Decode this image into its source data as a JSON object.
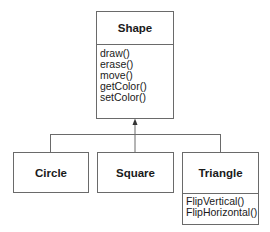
{
  "diagram": {
    "type": "uml-class-inheritance",
    "line_color": "#6a6a6a",
    "parent": {
      "name": "Shape",
      "operations": [
        "draw()",
        "erase()",
        "move()",
        "getColor()",
        "setColor()"
      ]
    },
    "children": [
      {
        "name": "Circle",
        "operations": []
      },
      {
        "name": "Square",
        "operations": []
      },
      {
        "name": "Triangle",
        "operations": [
          "FlipVertical()",
          "FlipHorizontal()"
        ]
      }
    ]
  }
}
